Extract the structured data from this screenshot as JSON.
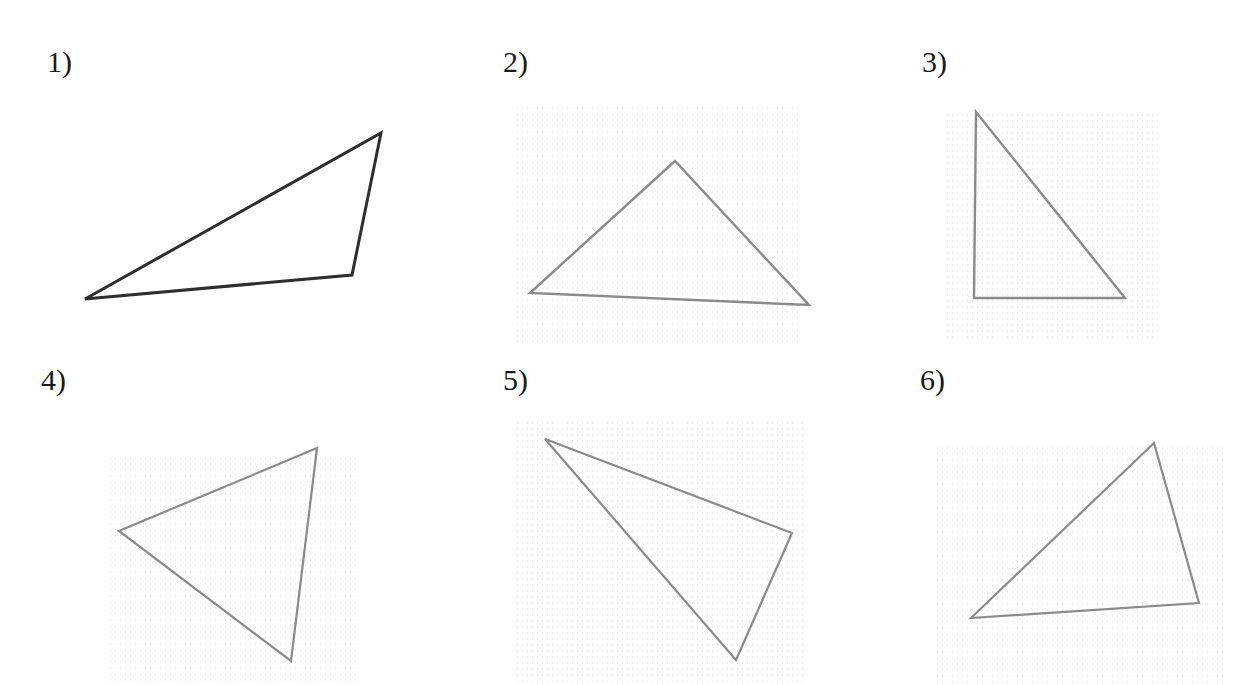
{
  "worksheet": {
    "problems": [
      {
        "label": "1)",
        "label_pos": [
          47,
          47
        ],
        "stroke": "#2e2e2e",
        "stroke_width": 3,
        "vertices": [
          [
            85,
            299
          ],
          [
            381,
            133
          ],
          [
            352,
            275
          ]
        ],
        "texture": null
      },
      {
        "label": "2)",
        "label_pos": [
          503,
          47
        ],
        "stroke": "#8a8a8a",
        "stroke_width": 2.4,
        "vertices": [
          [
            530,
            293
          ],
          [
            675,
            161
          ],
          [
            809,
            305
          ]
        ],
        "texture": [
          515,
          105,
          285,
          240
        ]
      },
      {
        "label": "3)",
        "label_pos": [
          922,
          47
        ],
        "stroke": "#8a8a8a",
        "stroke_width": 2.4,
        "vertices": [
          [
            976,
            112
          ],
          [
            974,
            298
          ],
          [
            1125,
            298
          ]
        ],
        "texture": [
          945,
          112,
          215,
          230
        ]
      },
      {
        "label": "4)",
        "label_pos": [
          41,
          365
        ],
        "stroke": "#8a8a8a",
        "stroke_width": 2.2,
        "vertices": [
          [
            119,
            531
          ],
          [
            317,
            448
          ],
          [
            291,
            661
          ]
        ],
        "texture": [
          108,
          455,
          250,
          230
        ]
      },
      {
        "label": "5)",
        "label_pos": [
          503,
          365
        ],
        "stroke": "#8a8a8a",
        "stroke_width": 2.2,
        "vertices": [
          [
            545,
            439
          ],
          [
            792,
            533
          ],
          [
            736,
            660
          ]
        ],
        "texture": [
          515,
          420,
          290,
          265
        ]
      },
      {
        "label": "6)",
        "label_pos": [
          920,
          365
        ],
        "stroke": "#8a8a8a",
        "stroke_width": 2.2,
        "vertices": [
          [
            971,
            618
          ],
          [
            1154,
            443
          ],
          [
            1199,
            603
          ]
        ],
        "texture": [
          935,
          445,
          290,
          240
        ]
      }
    ]
  }
}
